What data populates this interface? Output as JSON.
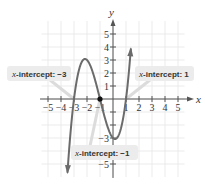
{
  "chart_data": {
    "type": "line",
    "title": "",
    "function": "y = (x + 3)(x + 1)(x - 1)",
    "xlabel": "x",
    "ylabel": "y",
    "xlim": [
      -5.5,
      5.5
    ],
    "ylim": [
      -6,
      6
    ],
    "grid": true,
    "x_ticks": [
      -5,
      -4,
      -3,
      -2,
      -1,
      1,
      2,
      3,
      4,
      5
    ],
    "x_tick_labels": [
      "−5",
      "−4",
      "−3",
      "−2",
      "−1",
      "1",
      "2",
      "3",
      "4",
      "5"
    ],
    "y_ticks": [
      5,
      4,
      3,
      2,
      1,
      -1,
      -2,
      -3,
      -4,
      -5
    ],
    "y_tick_labels": [
      "5",
      "4",
      "3",
      "2",
      "1",
      "−1",
      "−2",
      "−3",
      "−4",
      "−5"
    ],
    "series": [
      {
        "name": "polynomial",
        "x_range": [
          -3.5,
          1.37
        ],
        "key_points": [
          {
            "x": -3.5,
            "y": -5.63
          },
          {
            "x": -3,
            "y": 0
          },
          {
            "x": -2.15,
            "y": 3.08
          },
          {
            "x": -1,
            "y": 0
          },
          {
            "x": 0,
            "y": -3
          },
          {
            "x": 0.15,
            "y": -3.08
          },
          {
            "x": 1,
            "y": 0
          },
          {
            "x": 1.37,
            "y": 5.3
          }
        ],
        "color": "#6b6b6b"
      }
    ],
    "highlighted_points": [
      {
        "x": -1,
        "y": 0,
        "filled": true
      }
    ],
    "annotations": [
      {
        "id": "left",
        "prefix": "x",
        "text": "-intercept: −3",
        "points_to": {
          "x": -3,
          "y": 0
        }
      },
      {
        "id": "right",
        "prefix": "x",
        "text": "-intercept: 1",
        "points_to": {
          "x": 1,
          "y": 0
        }
      },
      {
        "id": "bottom",
        "prefix": "x",
        "text": "-intercept: −1",
        "points_to": {
          "x": -1,
          "y": 0
        }
      }
    ]
  },
  "axes": {
    "x_name": "x",
    "y_name": "y"
  },
  "callouts": {
    "left": {
      "var": "x",
      "text": "-intercept: −3"
    },
    "right": {
      "var": "x",
      "text": "-intercept: 1"
    },
    "bottom": {
      "var": "x",
      "text": "-intercept: −1"
    }
  }
}
